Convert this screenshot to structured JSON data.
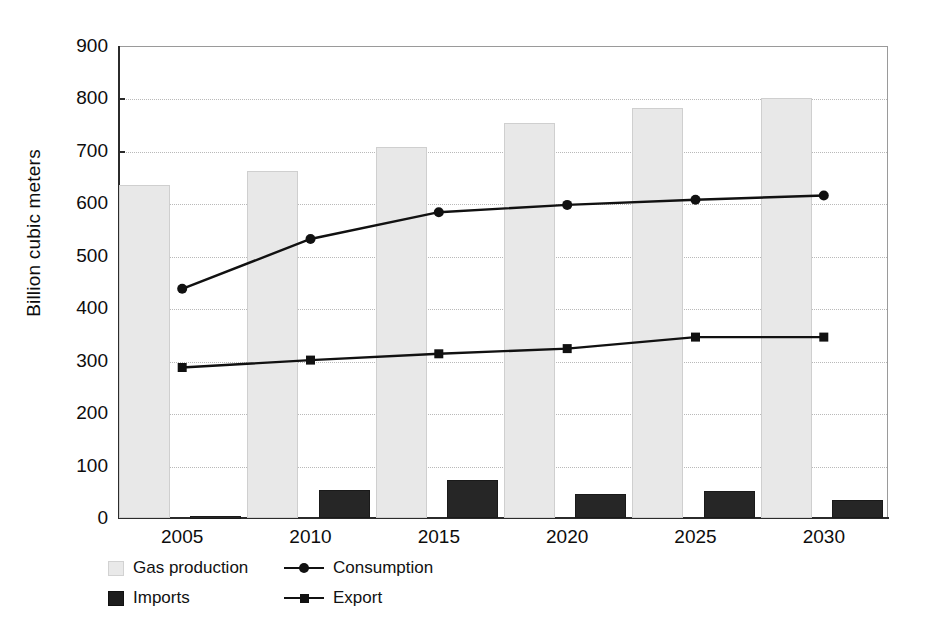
{
  "chart_data": {
    "type": "bar",
    "title": "",
    "subtitle": "",
    "xlabel": "",
    "ylabel": "Billion cubic meters",
    "categories": [
      "2005",
      "2010",
      "2015",
      "2020",
      "2025",
      "2030"
    ],
    "ylim": [
      0,
      900
    ],
    "y_ticks": [
      0,
      100,
      200,
      300,
      400,
      500,
      600,
      700,
      800,
      900
    ],
    "grid": true,
    "legend_position": "bottom-left",
    "series": [
      {
        "name": "Gas production",
        "type": "bar",
        "color": "#e8e8e8",
        "values": [
          635,
          661,
          707,
          754,
          781,
          800
        ]
      },
      {
        "name": "Imports",
        "type": "bar",
        "color": "#262626",
        "values": [
          4,
          53,
          72,
          46,
          52,
          35
        ]
      },
      {
        "name": "Consumption",
        "type": "line",
        "marker": "circle",
        "color": "#111111",
        "values": [
          437,
          532,
          583,
          597,
          607,
          615
        ]
      },
      {
        "name": "Export",
        "type": "line",
        "marker": "square",
        "color": "#111111",
        "values": [
          287,
          301,
          313,
          323,
          345,
          345
        ]
      }
    ]
  },
  "axis": {
    "y_title": "Billion cubic meters",
    "y_tick_labels": [
      "900",
      "800",
      "700",
      "600",
      "500",
      "400",
      "300",
      "200",
      "100",
      "0"
    ],
    "x_tick_labels": [
      "2005",
      "2010",
      "2015",
      "2020",
      "2025",
      "2030"
    ]
  },
  "legend": {
    "items": [
      {
        "label": "Gas production",
        "key": "swatch-light"
      },
      {
        "label": "Consumption",
        "key": "line-circle"
      },
      {
        "label": "Imports",
        "key": "swatch-dark"
      },
      {
        "label": "Export",
        "key": "line-square"
      }
    ]
  }
}
